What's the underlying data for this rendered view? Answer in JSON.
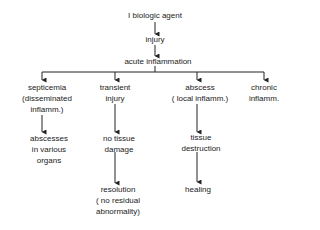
{
  "root": "I biologic agent",
  "level1": "injury",
  "level2": "acute inflammation",
  "branches": [
    {
      "label": [
        "septicemia",
        "(disseminated",
        "inflamm.)"
      ],
      "next": [
        "abscesses",
        "in various",
        "organs"
      ]
    },
    {
      "label": [
        "transient",
        "injury"
      ],
      "next": [
        "no tissue",
        "damage"
      ],
      "final": [
        "resolution",
        "( no  residual",
        "abnormality)"
      ]
    },
    {
      "label": [
        "abscess",
        "( local inflamm.)"
      ],
      "next": [
        "tissue",
        "destruction"
      ],
      "final": [
        "healing"
      ]
    },
    {
      "label": [
        "chronic",
        "inflamm."
      ]
    }
  ]
}
